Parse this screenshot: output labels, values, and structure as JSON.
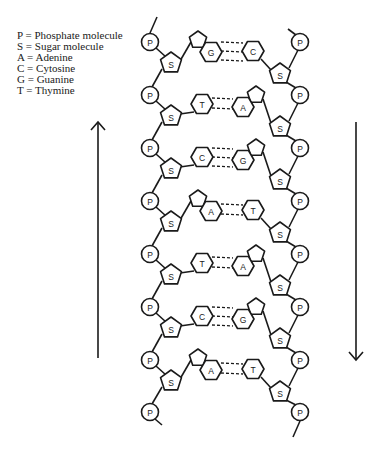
{
  "legend": [
    {
      "symbol": "P",
      "text": "P = Phosphate molecule"
    },
    {
      "symbol": "S",
      "text": "S = Sugar molecule"
    },
    {
      "symbol": "A",
      "text": "A = Adenine"
    },
    {
      "symbol": "C",
      "text": "C = Cytosine"
    },
    {
      "symbol": "G",
      "text": "G = Guanine"
    },
    {
      "symbol": "T",
      "text": "T = Thymine"
    }
  ],
  "labels": {
    "phosphate": "P",
    "sugar": "S"
  },
  "strands": {
    "left_direction": "up",
    "right_direction": "down"
  },
  "arrows": {
    "left": {
      "x": 98,
      "y_top": 122,
      "y_bottom": 358,
      "direction": "up"
    },
    "right": {
      "x": 356,
      "y_top": 122,
      "y_bottom": 360,
      "direction": "down"
    }
  },
  "geometry": {
    "left_p_x": 150,
    "right_p_x": 300,
    "p_y": [
      42,
      95,
      148,
      201,
      254,
      307,
      360,
      412
    ],
    "left_s_x": 171,
    "right_s_x": 280,
    "pitch": 53
  },
  "base_pairs": [
    {
      "left": "G",
      "right": "C",
      "left_type": "purine",
      "right_type": "pyrimidine",
      "bonds": 3
    },
    {
      "left": "T",
      "right": "A",
      "left_type": "pyrimidine",
      "right_type": "purine",
      "bonds": 2
    },
    {
      "left": "C",
      "right": "G",
      "left_type": "pyrimidine",
      "right_type": "purine",
      "bonds": 3
    },
    {
      "left": "A",
      "right": "T",
      "left_type": "purine",
      "right_type": "pyrimidine",
      "bonds": 2
    },
    {
      "left": "T",
      "right": "A",
      "left_type": "pyrimidine",
      "right_type": "purine",
      "bonds": 2
    },
    {
      "left": "C",
      "right": "G",
      "left_type": "pyrimidine",
      "right_type": "purine",
      "bonds": 3
    },
    {
      "left": "A",
      "right": "T",
      "left_type": "purine",
      "right_type": "pyrimidine",
      "bonds": 2
    }
  ],
  "colors": {
    "ink": "#1a1a1a",
    "background": "#ffffff"
  }
}
